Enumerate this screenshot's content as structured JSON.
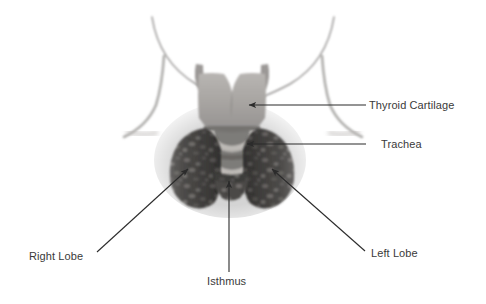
{
  "figure": {
    "background_color": "#ffffff",
    "text_color": "#3a3a3a",
    "leader_line_color": "#2b2b2b"
  },
  "labels": [
    {
      "id": "thyroid-cartilage",
      "text": "Thyroid Cartilage",
      "leader": "horizontal-arrow-left",
      "arrow_tip": {
        "x": 249,
        "y": 105
      },
      "arrow_tail": {
        "x": 366,
        "y": 105
      }
    },
    {
      "id": "trachea",
      "text": "Trachea",
      "leader": "horizontal-arrow-left",
      "arrow_tip": {
        "x": 247,
        "y": 144
      },
      "arrow_tail": {
        "x": 366,
        "y": 144
      }
    },
    {
      "id": "right-lobe",
      "text": "Right Lobe",
      "leader": "diagonal-arrow-up-right",
      "arrow_tip": {
        "x": 188,
        "y": 169
      },
      "arrow_tail": {
        "x": 97,
        "y": 252
      }
    },
    {
      "id": "left-lobe",
      "text": "Left Lobe",
      "leader": "diagonal-arrow-up-left",
      "arrow_tip": {
        "x": 272,
        "y": 169
      },
      "arrow_tail": {
        "x": 365,
        "y": 251
      }
    },
    {
      "id": "isthmus",
      "text": "Isthmus",
      "leader": "vertical-arrow-up",
      "arrow_tip": {
        "x": 229,
        "y": 181
      },
      "arrow_tail": {
        "x": 229,
        "y": 272
      }
    }
  ],
  "anatomy": {
    "neck_outline": {
      "name": "neck-and-jaw-outline",
      "color": "#8a8a8a"
    },
    "thyroid_cartilage": {
      "name": "thyroid-cartilage-shield",
      "color": "#a8a5a2"
    },
    "trachea": {
      "name": "trachea-rings",
      "color": "#c9c6c2",
      "ring_count": 2
    },
    "right_lobe": {
      "name": "thyroid-right-lobe",
      "color": "#4e4c4a"
    },
    "left_lobe": {
      "name": "thyroid-left-lobe",
      "color": "#4e4c4a"
    },
    "isthmus": {
      "name": "thyroid-isthmus",
      "color": "#565452"
    }
  }
}
